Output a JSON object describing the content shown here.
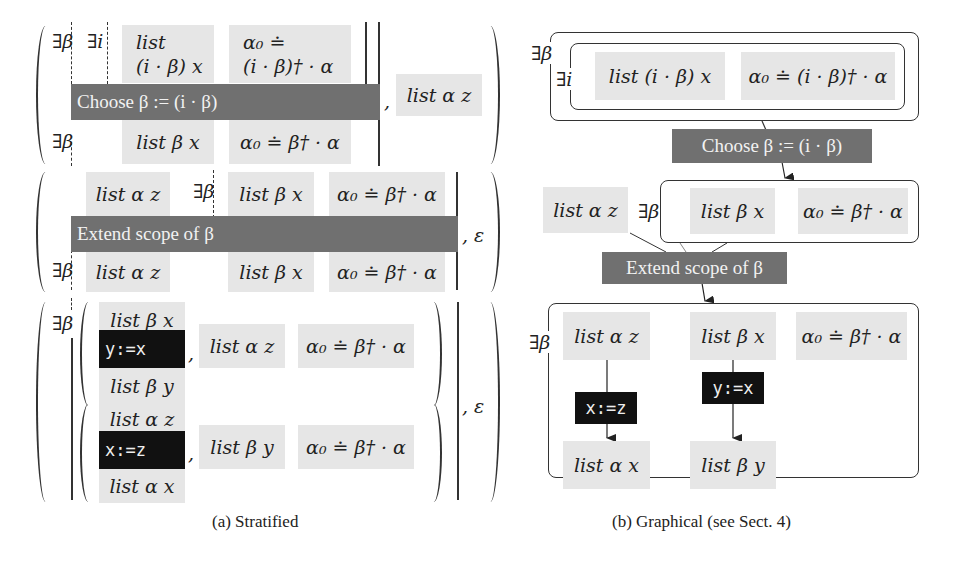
{
  "figure": {
    "panel_a": {
      "caption": "(a) Stratified",
      "block1": {
        "exists_beta_top": "∃β",
        "exists_i": "∃i",
        "box_list_line1": "list",
        "box_list_line2": "(i · β) x",
        "box_alpha_line1": "α₀ ≐",
        "box_alpha_line2": "(i · β)† · α",
        "bar_label": "Choose β := (i · β)",
        "exists_beta_bottom": "∃β",
        "box_list_beta_x": "list β x",
        "box_alpha_beta": "α₀ ≐ β† · α",
        "comma": ",",
        "box_list_alpha_z": "list α z"
      },
      "block2": {
        "box_list_alpha_z_top": "list α z",
        "exists_beta_top": "∃β",
        "box_list_beta_x_top": "list β x",
        "box_alpha_beta_top": "α₀ ≐ β† · α",
        "bar_label": "Extend scope of β",
        "exists_beta_bottom": "∃β",
        "box_list_alpha_z_bottom": "list α z",
        "box_list_beta_x_bottom": "list β x",
        "box_alpha_beta_bottom": "α₀ ≐ β† · α",
        "epsilon": ", ε"
      },
      "block3": {
        "exists_beta": "∃β",
        "sub1": {
          "pre": "list β x",
          "code": "y:=x",
          "post": "list β y",
          "comma": ",",
          "box_list": "list α z",
          "box_alpha": "α₀ ≐ β† · α"
        },
        "sub2": {
          "pre": "list α z",
          "code": "x:=z",
          "post": "list α x",
          "comma": ",",
          "box_list": "list β y",
          "box_alpha": "α₀ ≐ β† · α"
        },
        "epsilon": ", ε"
      }
    },
    "panel_b": {
      "caption": "(b) Graphical (see Sect. 4)",
      "top": {
        "exists_beta": "∃β",
        "exists_i": "∃i",
        "box_list": "list (i · β) x",
        "box_alpha": "α₀ ≐ (i · β)† · α"
      },
      "choose_label": "Choose β := (i · β)",
      "middle": {
        "box_list_alpha_z": "list α z",
        "exists_beta": "∃β",
        "box_list_beta_x": "list β x",
        "box_alpha": "α₀ ≐ β† · α"
      },
      "extend_label": "Extend scope of β",
      "bottom": {
        "exists_beta": "∃β",
        "box_list_alpha_z": "list α z",
        "box_list_beta_x": "list β x",
        "box_alpha": "α₀ ≐ β† · α",
        "code_xz": "x:=z",
        "code_yx": "y:=x",
        "box_list_alpha_x": "list α x",
        "box_list_beta_y": "list β y"
      }
    }
  }
}
